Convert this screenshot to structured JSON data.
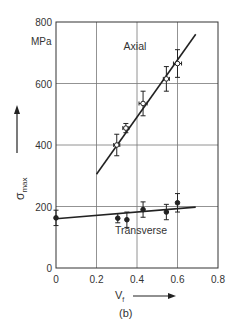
{
  "chart_data": {
    "type": "scatter",
    "title": "",
    "subtitle": "",
    "panel_label": "(b)",
    "xlabel": "Vf",
    "xlabel_main": "V",
    "xlabel_sub": "f",
    "ylabel": "σmax",
    "ylabel_main": "σ",
    "ylabel_sub": "max",
    "y_unit": "MPa",
    "xlim": [
      0,
      0.8
    ],
    "ylim": [
      0,
      800
    ],
    "x_ticks": [
      0,
      0.2,
      0.4,
      0.6,
      0.8
    ],
    "x_tick_labels": [
      "0",
      "0.2",
      "0.4",
      "0.6",
      "0.8"
    ],
    "y_ticks": [
      0,
      200,
      400,
      600,
      800
    ],
    "y_tick_labels": [
      "0",
      "200",
      "400",
      "600",
      "800"
    ],
    "grid": true,
    "legend": "inline annotations",
    "series": [
      {
        "name": "Axial",
        "marker": "open-circle-with-xy-errorbars",
        "points": [
          {
            "x": 0.3,
            "y": 400,
            "y_err": 35,
            "x_err": 0.015
          },
          {
            "x": 0.345,
            "y": 455,
            "y_err": 15,
            "x_err": 0.015
          },
          {
            "x": 0.43,
            "y": 535,
            "y_err": 40,
            "x_err": 0.02
          },
          {
            "x": 0.545,
            "y": 615,
            "y_err": 40,
            "x_err": 0.015
          },
          {
            "x": 0.6,
            "y": 665,
            "y_err": 45,
            "x_err": 0.02
          }
        ],
        "fit_line": {
          "x": [
            0.2,
            0.69
          ],
          "y": [
            305,
            760
          ]
        }
      },
      {
        "name": "Transverse",
        "marker": "filled-circle-with-errorbars",
        "points": [
          {
            "x": 0.0,
            "y": 163,
            "y_err": 25
          },
          {
            "x": 0.305,
            "y": 162,
            "y_err": 15
          },
          {
            "x": 0.35,
            "y": 157,
            "y_err": 25
          },
          {
            "x": 0.43,
            "y": 190,
            "y_err": 25
          },
          {
            "x": 0.545,
            "y": 182,
            "y_err": 25
          },
          {
            "x": 0.6,
            "y": 212,
            "y_err": 30
          }
        ],
        "fit_line": {
          "x": [
            0.0,
            0.69
          ],
          "y": [
            160,
            198
          ]
        }
      }
    ],
    "annotations": [
      {
        "text": "Axial",
        "x": 0.39,
        "y": 710
      },
      {
        "text": "Transverse",
        "x": 0.42,
        "y": 110
      }
    ]
  }
}
